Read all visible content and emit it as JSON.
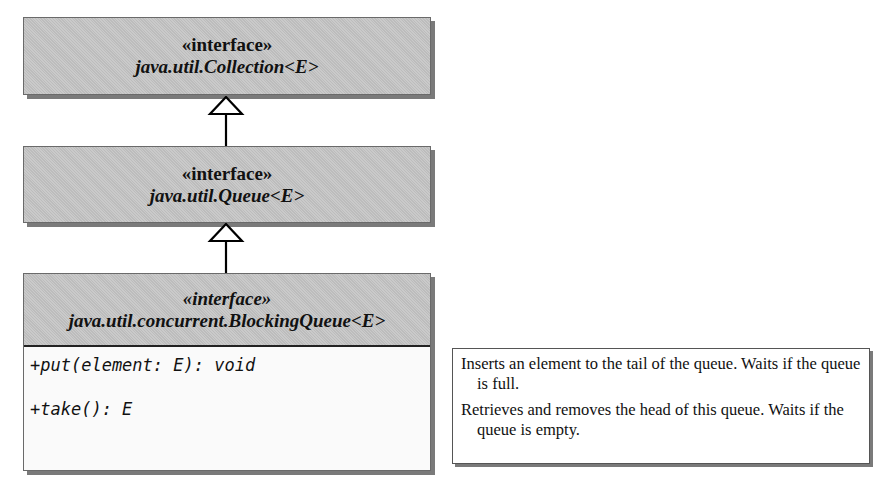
{
  "diagram": {
    "type": "uml-class-hierarchy",
    "interfaces": [
      {
        "stereotype": "«interface»",
        "name": "java.util.Collection<E>"
      },
      {
        "stereotype": "«interface»",
        "name": "java.util.Queue<E>"
      },
      {
        "stereotype": "«interface»",
        "name": "java.util.concurrent.BlockingQueue<E>",
        "methods": [
          "+put(element: E): void",
          "+take(): E"
        ]
      }
    ],
    "relationships": [
      {
        "from": "java.util.Queue<E>",
        "to": "java.util.Collection<E>",
        "type": "generalization"
      },
      {
        "from": "java.util.concurrent.BlockingQueue<E>",
        "to": "java.util.Queue<E>",
        "type": "generalization"
      }
    ],
    "descriptions": [
      "Inserts an element to the tail of the queue. Waits if the queue is full.",
      "Retrieves and removes the head of this queue. Waits if the queue is empty."
    ],
    "colors": {
      "header_fill": "#c4c4c4",
      "body_fill": "#fafafa",
      "shadow": "#7a7a7a"
    }
  }
}
